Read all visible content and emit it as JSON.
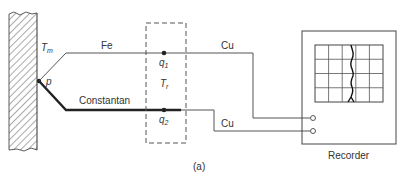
{
  "figure": {
    "caption": "(a)",
    "labels": {
      "wall_temperature": "T",
      "wall_temperature_sub": "m",
      "junction_point": "p",
      "reference_temperature": "T",
      "reference_temperature_sub": "r",
      "ref_junction_1": "q",
      "ref_junction_1_sub": "1",
      "ref_junction_2": "q",
      "ref_junction_2_sub": "2"
    },
    "wires": {
      "top_thermocouple": "Fe",
      "bottom_thermocouple": "Constantan",
      "top_lead": "Cu",
      "bottom_lead": "Cu"
    },
    "recorder": {
      "label": "Recorder",
      "grid_columns": 5,
      "grid_rows": 4
    },
    "colors": {
      "line": "#333333",
      "background": "#ffffff"
    }
  }
}
